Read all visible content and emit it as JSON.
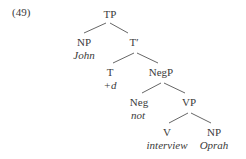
{
  "example_number": "(49)",
  "tree": {
    "TP": {
      "label": "TP"
    },
    "subject": {
      "label": "NP",
      "word": "John"
    },
    "Tbar": {
      "label": "T′"
    },
    "T": {
      "label": "T",
      "word": "+d"
    },
    "NegP": {
      "label": "NegP"
    },
    "Neg": {
      "label": "Neg",
      "word": "not"
    },
    "VP": {
      "label": "VP"
    },
    "V": {
      "label": "V",
      "word": "interview"
    },
    "object": {
      "label": "NP",
      "word": "Oprah"
    }
  }
}
